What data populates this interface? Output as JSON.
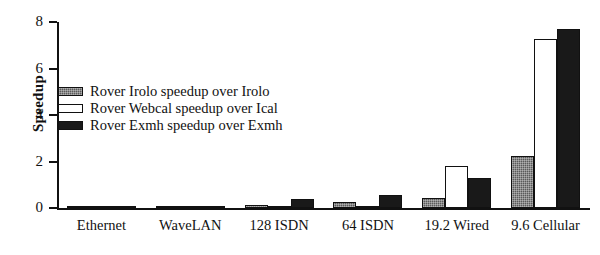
{
  "chart_data": {
    "type": "bar",
    "title": "",
    "xlabel": "",
    "ylabel": "Speedup",
    "ylim": [
      0,
      8
    ],
    "yticks": [
      0,
      2,
      4,
      6,
      8
    ],
    "ytick_labels": [
      "0",
      "2",
      "4",
      "6",
      "8"
    ],
    "grid": false,
    "legend_position": "upper left inside",
    "categories": [
      "Ethernet",
      "WaveLAN",
      "128 ISDN",
      "64 ISDN",
      "19.2 Wired",
      "9.6 Cellular"
    ],
    "series": [
      {
        "name": "Rover Irolo speedup over Irolo",
        "color": "#5a5a5a",
        "fill": "gray",
        "values": [
          0.07,
          0.1,
          0.12,
          0.25,
          0.45,
          2.25
        ]
      },
      {
        "name": "Rover Webcal speedup over Ical",
        "color": "#ffffff",
        "fill": "white",
        "values": [
          0.03,
          0.03,
          0.05,
          0.05,
          1.8,
          7.25
        ]
      },
      {
        "name": "Rover Exmh speedup over Exmh",
        "color": "#191919",
        "fill": "black",
        "values": [
          0.04,
          0.05,
          0.4,
          0.55,
          1.3,
          7.7
        ]
      }
    ]
  },
  "axis": {
    "y_title": "Speedup"
  }
}
